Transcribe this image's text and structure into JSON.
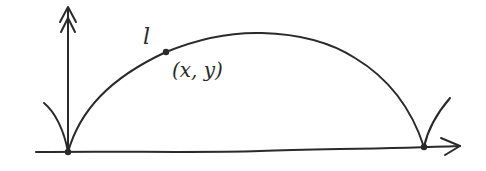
{
  "diagram": {
    "curve_label": "l",
    "point_label": "(x, y)",
    "colors": {
      "stroke": "#2a2a2a",
      "background": "#ffffff"
    },
    "elements": {
      "vertical_axis": "upward arrow with double arrowhead",
      "horizontal_axis": "rightward arrow",
      "curve": "arch (cycloid-like) from left cusp to right cusp",
      "point": "marked point on curve",
      "cusps": [
        "left cusp at origin",
        "right cusp on horizontal axis"
      ]
    }
  }
}
